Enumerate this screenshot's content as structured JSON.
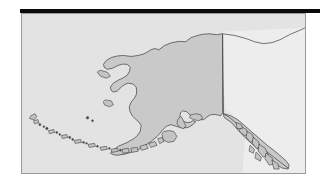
{
  "figure": {
    "title": "Alaska",
    "kind": "reference-map",
    "region_label": "Alaska",
    "projection_note": "Alaska with Aleutian Islands and Southeast Panhandle"
  },
  "colors": {
    "page_background": "#ffffff",
    "top_rule": "#0a0a0a",
    "map_background": "#e3e3e3",
    "map_frame_border": "#9a9a9a",
    "land_fill": "#c9c9c9",
    "land_outline": "#3a3a3a",
    "neighbor_fill": "#ededed",
    "island_fill": "#c4c4c4",
    "small_island_fill": "#4a4a4a"
  },
  "layout": {
    "canvas_width": 330,
    "canvas_height": 183,
    "top_rule": {
      "x": 20,
      "y": 9,
      "width": 300,
      "height": 4
    },
    "map_frame": {
      "x": 21,
      "y": 13,
      "width": 285,
      "height": 161
    }
  },
  "map": {
    "features": [
      {
        "name": "alaska-mainland",
        "type": "landmass"
      },
      {
        "name": "alaska-canada-border",
        "type": "political-border"
      },
      {
        "name": "canada-landmass",
        "type": "neighbor-landmass"
      },
      {
        "name": "aleutian-islands",
        "type": "island-chain"
      },
      {
        "name": "kodiak-island",
        "type": "island"
      },
      {
        "name": "st-lawrence-island",
        "type": "island"
      },
      {
        "name": "nunivak-island",
        "type": "island"
      },
      {
        "name": "pribilof-islands",
        "type": "island-group"
      },
      {
        "name": "alexander-archipelago",
        "type": "island-group"
      },
      {
        "name": "kenai-peninsula",
        "type": "peninsula"
      },
      {
        "name": "seward-peninsula",
        "type": "peninsula"
      },
      {
        "name": "alaska-peninsula",
        "type": "peninsula"
      },
      {
        "name": "southeast-panhandle",
        "type": "region"
      }
    ],
    "island_chain_counts": {
      "aleutian-islands": 34,
      "alexander-archipelago": 16
    }
  }
}
